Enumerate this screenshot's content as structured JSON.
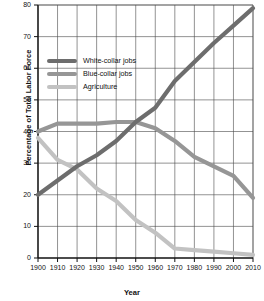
{
  "chart_data": {
    "type": "line",
    "title": "",
    "xlabel": "Year",
    "ylabel": "Percentage of Total Labor Force",
    "x": [
      1900,
      1910,
      1920,
      1930,
      1940,
      1950,
      1960,
      1970,
      1980,
      1990,
      2000,
      2010
    ],
    "xlim": [
      1900,
      2010
    ],
    "ylim": [
      0,
      80
    ],
    "xticks": [
      "1900",
      "1910",
      "1920",
      "1930",
      "1940",
      "1950",
      "1960",
      "1970",
      "1980",
      "1990",
      "2000",
      "2010"
    ],
    "yticks": [
      "0",
      "10",
      "20",
      "30",
      "40",
      "50",
      "60",
      "70",
      "80"
    ],
    "grid": true,
    "legend_position": "upper-left-inside",
    "series": [
      {
        "name": "White-collar jobs",
        "color": "#6d6d6d",
        "values": [
          20,
          24.5,
          29,
          32.5,
          37,
          43,
          47.5,
          56,
          62,
          68,
          73.5,
          79
        ]
      },
      {
        "name": "Blue-collar jobs",
        "color": "#969696",
        "values": [
          40,
          42.5,
          42.5,
          42.5,
          43,
          43,
          41,
          37,
          32,
          29,
          26,
          19
        ]
      },
      {
        "name": "Agriculture",
        "color": "#c2c2c2",
        "values": [
          38,
          31,
          28,
          22,
          18,
          12,
          8,
          3,
          2.5,
          2,
          1.5,
          1
        ]
      }
    ]
  },
  "axis": {
    "ylabel": "Percentage of Total Labor Force",
    "xlabel": "Year"
  },
  "legend": {
    "items": [
      {
        "label": "White-collar jobs"
      },
      {
        "label": "Blue-collar jobs"
      },
      {
        "label": "Agriculture"
      }
    ]
  }
}
